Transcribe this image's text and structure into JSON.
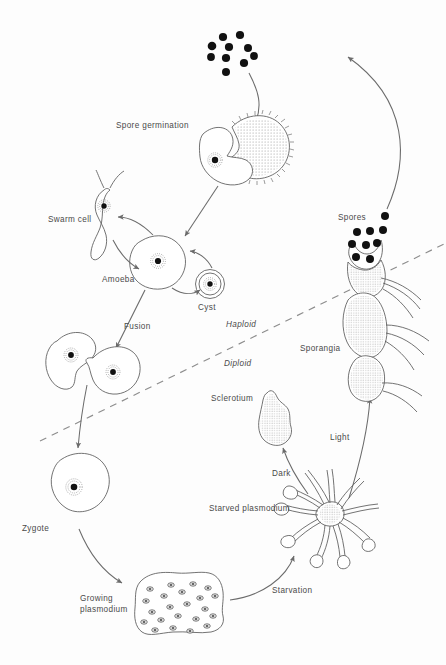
{
  "figure": {
    "background_color": "#fdfdfd",
    "line_color": "#5a5a5a",
    "arrow_color": "#6b6b6b",
    "text_color": "#4a4a4a",
    "spore_color": "#111111",
    "width": 446,
    "height": 665
  },
  "labels": {
    "spore_germination": "Spore germination",
    "swarm_cell": "Swarm cell",
    "amoeba": "Amoeba",
    "cyst": "Cyst",
    "fusion": "Fusion",
    "haploid": "Haploid",
    "diploid": "Diploid",
    "spores": "Spores",
    "sporangia": "Sporangia",
    "sclerotium": "Sclerotium",
    "light": "Light",
    "dark": "Dark",
    "starved_plasmodium": "Starved plasmodium",
    "starvation": "Starvation",
    "zygote": "Zygote",
    "growing_plasmodium_line1": "Growing",
    "growing_plasmodium_line2": "plasmodium"
  },
  "stages": [
    {
      "id": "spores-top",
      "name": "Spores (released cluster)",
      "count": 10
    },
    {
      "id": "spore-germination",
      "name": "Spore germination",
      "ploidy": "haploid"
    },
    {
      "id": "swarm-cell",
      "name": "Swarm cell",
      "ploidy": "haploid",
      "flagella": 2
    },
    {
      "id": "amoeba",
      "name": "Amoeba",
      "ploidy": "haploid",
      "nuclei": 1
    },
    {
      "id": "cyst",
      "name": "Cyst",
      "ploidy": "haploid",
      "nuclei": 1
    },
    {
      "id": "fusion",
      "name": "Fusion",
      "ploidy": "haploid",
      "nuclei": 2
    },
    {
      "id": "zygote",
      "name": "Zygote",
      "ploidy": "diploid",
      "nuclei": 1
    },
    {
      "id": "growing-plasmodium",
      "name": "Growing plasmodium",
      "ploidy": "diploid",
      "nuclei": 22
    },
    {
      "id": "starved-plasmodium",
      "name": "Starved plasmodium",
      "ploidy": "diploid"
    },
    {
      "id": "sclerotium",
      "name": "Sclerotium",
      "ploidy": "diploid"
    },
    {
      "id": "sporangia",
      "name": "Sporangia",
      "ploidy": "diploid"
    },
    {
      "id": "spores-sporangia",
      "name": "Spores",
      "count": 9
    }
  ],
  "transitions": [
    {
      "from": "spores-top",
      "to": "spore-germination",
      "label": ""
    },
    {
      "from": "spore-germination",
      "to": "amoeba",
      "label": ""
    },
    {
      "from": "amoeba",
      "to": "swarm-cell",
      "label": "",
      "reversible": true
    },
    {
      "from": "amoeba",
      "to": "cyst",
      "label": "",
      "reversible": true
    },
    {
      "from": "amoeba",
      "to": "fusion",
      "label": "Fusion"
    },
    {
      "from": "fusion",
      "to": "zygote",
      "label": ""
    },
    {
      "from": "zygote",
      "to": "growing-plasmodium",
      "label": ""
    },
    {
      "from": "growing-plasmodium",
      "to": "starved-plasmodium",
      "label": "Starvation"
    },
    {
      "from": "starved-plasmodium",
      "to": "sclerotium",
      "label": "Dark"
    },
    {
      "from": "starved-plasmodium",
      "to": "sporangia",
      "label": "Light"
    },
    {
      "from": "sporangia",
      "to": "spores-top",
      "label": ""
    }
  ],
  "ploidy_divider": {
    "style": "dashed",
    "above_label": "Haploid",
    "below_label": "Diploid"
  },
  "spore_dots_top": [
    {
      "x": 223,
      "y": 37
    },
    {
      "x": 239,
      "y": 35
    },
    {
      "x": 213,
      "y": 45
    },
    {
      "x": 228,
      "y": 47
    },
    {
      "x": 247,
      "y": 48
    },
    {
      "x": 211,
      "y": 57
    },
    {
      "x": 225,
      "y": 58
    },
    {
      "x": 243,
      "y": 62
    },
    {
      "x": 225,
      "y": 71
    },
    {
      "x": 253,
      "y": 55
    }
  ],
  "spore_dots_sporangia": [
    {
      "x": 385,
      "y": 216
    },
    {
      "x": 357,
      "y": 232
    },
    {
      "x": 370,
      "y": 231
    },
    {
      "x": 383,
      "y": 230
    },
    {
      "x": 352,
      "y": 244
    },
    {
      "x": 366,
      "y": 245
    },
    {
      "x": 377,
      "y": 243
    },
    {
      "x": 356,
      "y": 257
    },
    {
      "x": 370,
      "y": 259
    }
  ]
}
